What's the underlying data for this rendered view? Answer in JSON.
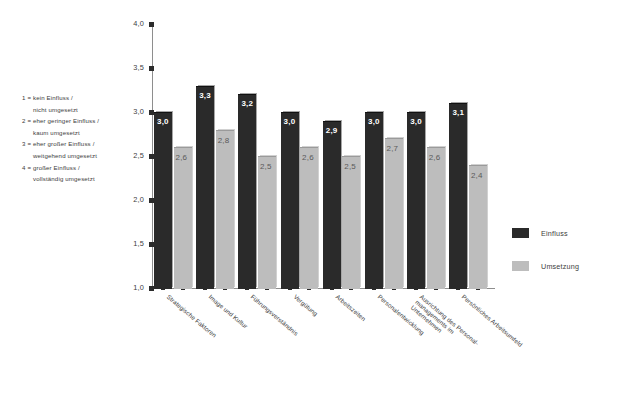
{
  "scale_key": {
    "lines": [
      "1 = kein Einfluss /",
      "nicht umgesetzt",
      "2 = eher geringer Einfluss /",
      "kaum umgesetzt",
      "3 = eher großer Einfluss /",
      "weitgehend umgesetzt",
      "4 = großer Einfluss /",
      "vollständig umgesetzt"
    ]
  },
  "legend": {
    "entries": [
      {
        "label": "Einfluss",
        "color": "#2a2a2a"
      },
      {
        "label": "Umsetzung",
        "color": "#bdbdbd"
      }
    ]
  },
  "chart_data": {
    "type": "bar",
    "title": "",
    "xlabel": "",
    "ylabel": "",
    "ylim": [
      1.0,
      4.0
    ],
    "ytick_values": [
      1.0,
      1.5,
      2.0,
      2.5,
      3.0,
      3.5,
      4.0
    ],
    "ytick_labels": [
      "1,0",
      "1,5",
      "2,0",
      "2,5",
      "3,0",
      "3,5",
      "4,0"
    ],
    "grid": false,
    "legend_position": "right",
    "categories": [
      "Strategische Faktoren",
      "Image und Kultur",
      "Führungsverständnis",
      "Vergütung",
      "Arbeitszeiten",
      "Personalentwicklung",
      "Ausrichtung des Personalmanagements im Unternehmen",
      "Persönliches Arbeitsumfeld"
    ],
    "category_lines": [
      [
        "Strategische Faktoren"
      ],
      [
        "Image und Kultur"
      ],
      [
        "Führungsverständnis"
      ],
      [
        "Vergütung"
      ],
      [
        "Arbeitszeiten"
      ],
      [
        "Personalentwicklung"
      ],
      [
        "Ausrichtung des Personal-",
        "managements im",
        "Unternehmen"
      ],
      [
        "Persönliches Arbeitsumfeld"
      ]
    ],
    "series": [
      {
        "name": "Einfluss",
        "color": "#2a2a2a",
        "values": [
          3.0,
          3.3,
          3.2,
          3.0,
          2.9,
          3.0,
          3.0,
          3.1
        ],
        "labels": [
          "3,0",
          "3,3",
          "3,2",
          "3,0",
          "2,9",
          "3,0",
          "3,0",
          "3,1"
        ]
      },
      {
        "name": "Umsetzung",
        "color": "#bdbdbd",
        "values": [
          2.6,
          2.8,
          2.5,
          2.6,
          2.5,
          2.7,
          2.6,
          2.4
        ],
        "labels": [
          "2,6",
          "2,8",
          "2,5",
          "2,6",
          "2,5",
          "2,7",
          "2,6",
          "2,4"
        ]
      }
    ]
  }
}
